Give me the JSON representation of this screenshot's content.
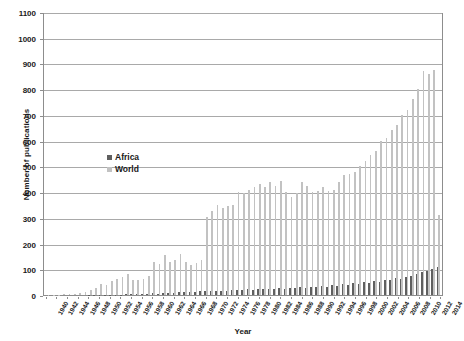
{
  "chart_data": {
    "type": "bar",
    "title": "",
    "xlabel": "Year",
    "ylabel": "Number of publications",
    "ylim": [
      0,
      1100
    ],
    "ytick_step": 100,
    "yticks": [
      0,
      100,
      200,
      300,
      400,
      500,
      600,
      700,
      800,
      900,
      1000,
      1100
    ],
    "grid": true,
    "legend_position": "inside-left",
    "xtick_step": 2,
    "xtick_first": 1940,
    "xtick_last": 2014,
    "colors": {
      "africa": "#5f5f5f",
      "world": "#c2c2c2",
      "axis": "#8d8d8d",
      "grid": "#a9a9a9"
    },
    "categories": [
      1940,
      1941,
      1942,
      1943,
      1944,
      1945,
      1946,
      1947,
      1948,
      1949,
      1950,
      1951,
      1952,
      1953,
      1954,
      1955,
      1956,
      1957,
      1958,
      1959,
      1960,
      1961,
      1962,
      1963,
      1964,
      1965,
      1966,
      1967,
      1968,
      1969,
      1970,
      1971,
      1972,
      1973,
      1974,
      1975,
      1976,
      1977,
      1978,
      1979,
      1980,
      1981,
      1982,
      1983,
      1984,
      1985,
      1986,
      1987,
      1988,
      1989,
      1990,
      1991,
      1992,
      1993,
      1994,
      1995,
      1996,
      1997,
      1998,
      1999,
      2000,
      2001,
      2002,
      2003,
      2004,
      2005,
      2006,
      2007,
      2008,
      2009,
      2010,
      2011,
      2012,
      2013,
      2014
    ],
    "series": [
      {
        "name": "Africa",
        "color": "#5f5f5f",
        "values": [
          0,
          0,
          0,
          0,
          0,
          0,
          0,
          0,
          1,
          1,
          2,
          1,
          2,
          2,
          2,
          3,
          3,
          4,
          4,
          5,
          6,
          5,
          8,
          7,
          9,
          10,
          12,
          11,
          13,
          14,
          15,
          14,
          16,
          15,
          17,
          18,
          20,
          19,
          22,
          21,
          23,
          22,
          25,
          24,
          26,
          25,
          28,
          27,
          30,
          29,
          32,
          30,
          35,
          33,
          38,
          36,
          42,
          40,
          46,
          44,
          50,
          48,
          55,
          52,
          58,
          60,
          66,
          62,
          70,
          74,
          82,
          88,
          92,
          100,
          110
        ]
      },
      {
        "name": "World",
        "color": "#c2c2c2",
        "values": [
          2,
          2,
          2,
          3,
          4,
          4,
          6,
          12,
          20,
          28,
          42,
          38,
          55,
          62,
          70,
          82,
          60,
          58,
          62,
          75,
          128,
          120,
          155,
          130,
          135,
          160,
          130,
          115,
          125,
          135,
          305,
          325,
          350,
          340,
          345,
          350,
          400,
          395,
          410,
          420,
          430,
          420,
          440,
          425,
          445,
          400,
          380,
          395,
          440,
          425,
          400,
          405,
          420,
          405,
          410,
          440,
          465,
          470,
          480,
          500,
          520,
          545,
          560,
          600,
          610,
          640,
          660,
          700,
          720,
          760,
          800,
          870,
          860,
          875,
          310
        ]
      }
    ]
  },
  "legend": {
    "items": [
      {
        "label": "Africa"
      },
      {
        "label": "World"
      }
    ]
  },
  "axis": {
    "y_title": "Number of publications",
    "x_title": "Year"
  }
}
